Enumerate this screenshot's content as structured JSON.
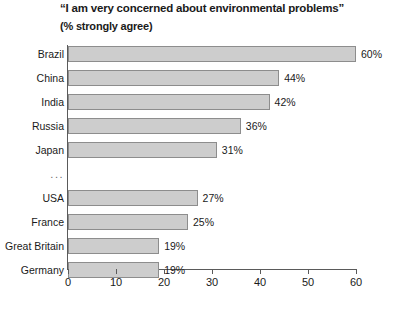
{
  "chart_data": {
    "type": "bar",
    "orientation": "horizontal",
    "title": "“I am very concerned about environmental problems”",
    "subtitle": "(% strongly agree)",
    "xlabel": "",
    "ylabel": "",
    "xlim": [
      0,
      60
    ],
    "grid": false,
    "legend": null,
    "xticks": [
      0,
      10,
      20,
      30,
      40,
      50,
      60
    ],
    "xtick_labels": [
      "0",
      "10",
      "20",
      "30",
      "40",
      "50",
      "60"
    ],
    "categories": [
      "Brazil",
      "China",
      "India",
      "Russia",
      "Japan",
      "...",
      "USA",
      "France",
      "Great Britain",
      "Germany"
    ],
    "values": [
      60,
      44,
      42,
      36,
      31,
      null,
      27,
      25,
      19,
      19
    ],
    "value_labels": [
      "60%",
      "44%",
      "42%",
      "36%",
      "31%",
      "",
      "27%",
      "25%",
      "19%",
      "19%"
    ],
    "bars": [
      {
        "label": "Brazil",
        "value": 60,
        "value_label": "60%",
        "is_gap": false
      },
      {
        "label": "China",
        "value": 44,
        "value_label": "44%",
        "is_gap": false
      },
      {
        "label": "India",
        "value": 42,
        "value_label": "42%",
        "is_gap": false
      },
      {
        "label": "Russia",
        "value": 36,
        "value_label": "36%",
        "is_gap": false
      },
      {
        "label": "Japan",
        "value": 31,
        "value_label": "31%",
        "is_gap": false
      },
      {
        "label": "...",
        "value": null,
        "value_label": "",
        "is_gap": true
      },
      {
        "label": "USA",
        "value": 27,
        "value_label": "27%",
        "is_gap": false
      },
      {
        "label": "France",
        "value": 25,
        "value_label": "25%",
        "is_gap": false
      },
      {
        "label": "Great Britain",
        "value": 19,
        "value_label": "19%",
        "is_gap": false
      },
      {
        "label": "Germany",
        "value": 19,
        "value_label": "19%",
        "is_gap": false
      }
    ],
    "colors": {
      "bar_fill": "#cdcdcd",
      "bar_border": "#8d8d8d",
      "axis": "#5a5a5a",
      "text": "#1a1a1a",
      "background": "#ffffff"
    }
  }
}
